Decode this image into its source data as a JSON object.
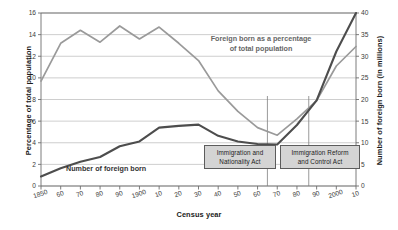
{
  "chart_data": {
    "type": "line",
    "title": "",
    "xlabel": "Census year",
    "ylabel": "Percentage of total population",
    "ylabel_right": "Number of foreign born (in millions)",
    "grid": true,
    "legend_position": "inline-annotations",
    "x": [
      1850,
      1860,
      1870,
      1880,
      1890,
      1900,
      1910,
      1920,
      1930,
      1940,
      1950,
      1960,
      1970,
      1980,
      1990,
      2000,
      2010
    ],
    "xtick_labels": [
      "1850",
      "60",
      "70",
      "80",
      "90",
      "1900",
      "10",
      "20",
      "30",
      "40",
      "50",
      "60",
      "70",
      "80",
      "90",
      "2000",
      "10"
    ],
    "ylim_left": [
      0,
      16
    ],
    "ytick_labels_left": [
      "0",
      "2",
      "4",
      "6",
      "8",
      "10",
      "12",
      "14",
      "16"
    ],
    "ytick_values_left": [
      0,
      2,
      4,
      6,
      8,
      10,
      12,
      14,
      16
    ],
    "ylim_right": [
      0,
      40
    ],
    "ytick_labels_right": [
      "0",
      "5",
      "10",
      "15",
      "20",
      "25",
      "30",
      "35",
      "40"
    ],
    "ytick_values_right": [
      0,
      5,
      10,
      15,
      20,
      25,
      30,
      35,
      40
    ],
    "series": [
      {
        "name": "Foreign born as a percentage of total population",
        "axis": "left",
        "color": "#9a9a9a",
        "values": [
          9.7,
          13.2,
          14.4,
          13.3,
          14.8,
          13.6,
          14.7,
          13.2,
          11.6,
          8.8,
          6.9,
          5.4,
          4.7,
          6.2,
          7.9,
          11.1,
          12.9
        ]
      },
      {
        "name": "Number of foreign born",
        "axis": "right",
        "color": "#4d4d4d",
        "values": [
          2.2,
          4.1,
          5.6,
          6.7,
          9.2,
          10.3,
          13.5,
          13.9,
          14.2,
          11.6,
          10.3,
          9.7,
          9.6,
          14.1,
          19.8,
          31.1,
          40.0
        ]
      }
    ],
    "annotations": [
      {
        "id": "immigration-and-nationality-act",
        "label": "Immigration and Nationality Act",
        "line1": "Immigration and",
        "line2": "Nationality Act",
        "year": 1965
      },
      {
        "id": "immigration-reform-and-control-act",
        "label": "Immigration Reform and Control Act",
        "line1": "Immigration Reform",
        "line2": "and Control Act",
        "year": 1986
      }
    ],
    "series_labels": {
      "percentage_line1": "Foreign born as a percentage",
      "percentage_line2": "of total population",
      "number": "Number of foreign born"
    }
  }
}
